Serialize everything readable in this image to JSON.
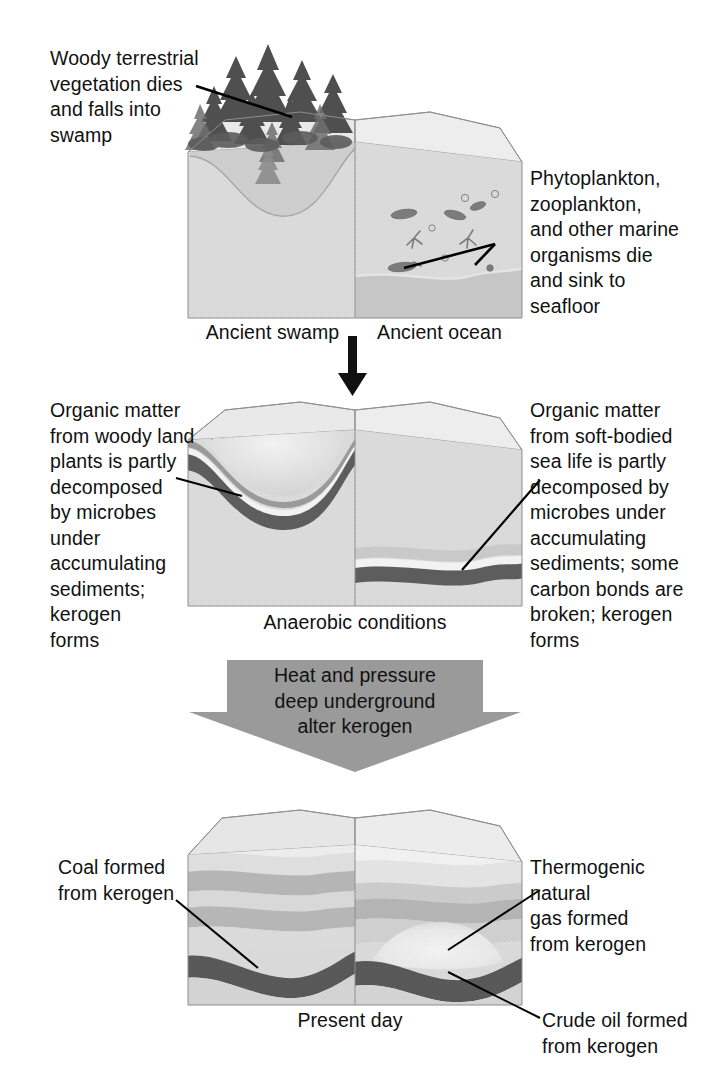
{
  "diagram": {
    "type": "process-diagram",
    "stages": 3
  },
  "stage1": {
    "name": "Ancient environments",
    "left_caption": "Woody terrestrial\nvegetation dies\nand falls into\nswamp",
    "right_caption": "Phytoplankton,\nzooplankton,\nand other marine\norganisms die\nand sink to\nseafloor",
    "left_label": "Ancient swamp",
    "right_label": "Ancient ocean"
  },
  "stage2": {
    "name": "Decomposition and kerogen formation",
    "left_caption": "Organic matter\nfrom woody land\nplants is partly\ndecomposed\nby microbes\nunder\naccumulating\nsediments;\nkerogen\nforms",
    "right_caption": "Organic matter\nfrom soft-bodied\nsea life is partly\ndecomposed by\nmicrobes under\naccumulating\nsediments; some\ncarbon bonds are\nbroken; kerogen\nforms",
    "center_label": "Anaerobic conditions"
  },
  "process_arrow": {
    "text": "Heat and pressure\ndeep underground\nalter kerogen"
  },
  "stage3": {
    "name": "Present-day fossil fuel deposits",
    "left_caption": "Coal formed\nfrom kerogen",
    "right_caption": "Thermogenic\nnatural\ngas formed\nfrom kerogen",
    "bottom_right_caption": "Crude oil formed\nfrom kerogen",
    "center_label": "Present day"
  },
  "colors": {
    "page_background": "#ffffff",
    "text": "#111111",
    "block_top_light": "#e6e6e6",
    "block_face_mid": "#b4b4b4",
    "block_face_light": "#cfcfcf",
    "water_gray": "#b9b9b9",
    "sediment_dark": "#5d5d5d",
    "sediment_mid": "#8f8f8f",
    "sediment_pale": "#d8d8d8",
    "coal_black": "#000000",
    "gas_light": "#dcdcdc",
    "arrow_gray": "#9a9a9a",
    "outline": "#8e8e8e"
  }
}
